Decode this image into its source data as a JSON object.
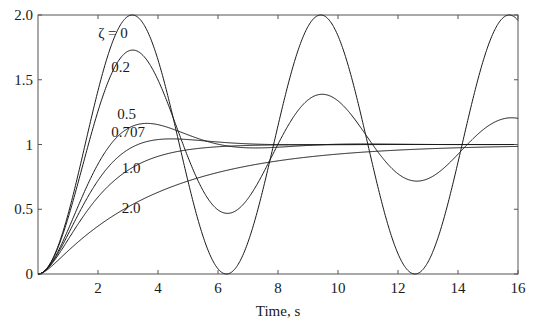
{
  "chart_data": {
    "type": "line",
    "title": "",
    "xlabel": "Time, s",
    "ylabel": "",
    "xlim": [
      0,
      16
    ],
    "ylim": [
      0,
      2.0
    ],
    "grid": false,
    "legend": "inline curve labels",
    "x_ticks": [
      2,
      4,
      6,
      8,
      10,
      12,
      14,
      16
    ],
    "x_tick_labels": [
      "2",
      "4",
      "6",
      "8",
      "10",
      "12",
      "14",
      "16"
    ],
    "y_ticks": [
      0,
      0.5,
      1,
      1.5,
      2.0
    ],
    "y_tick_labels": [
      "0",
      "0.5",
      "1",
      "1.5",
      "2.0"
    ],
    "x": [
      0,
      1,
      2,
      3,
      4,
      5,
      6,
      7,
      8,
      9,
      10,
      11,
      12,
      13,
      14,
      15,
      16
    ],
    "series": [
      {
        "name": "ζ = 0",
        "zeta_curve": 0,
        "values": [
          0,
          0.46,
          1.42,
          1.99,
          1.65,
          0.72,
          0.04,
          0.25,
          1.15,
          1.91,
          1.84,
          1.0,
          0.16,
          0.09,
          0.86,
          1.76,
          1.96
        ]
      },
      {
        "name": "0.2",
        "zeta_curve": 0.1,
        "values": [
          0,
          0.45,
          1.36,
          1.71,
          1.45,
          0.89,
          0.52,
          0.64,
          1.12,
          1.37,
          1.25,
          0.96,
          0.78,
          0.82,
          1.01,
          1.16,
          1.14
        ]
      },
      {
        "name": "0.5",
        "zeta_curve": 0.5,
        "values": [
          0,
          0.34,
          0.84,
          1.11,
          1.16,
          1.09,
          1.02,
          0.99,
          0.99,
          1.0,
          1.0,
          1.0,
          1.0,
          1.0,
          1.0,
          1.0,
          1.0
        ]
      },
      {
        "name": "0.707",
        "zeta_curve": 0.707,
        "values": [
          0,
          0.31,
          0.74,
          0.98,
          1.05,
          1.05,
          1.02,
          1.01,
          1.0,
          1.0,
          1.0,
          1.0,
          1.0,
          1.0,
          1.0,
          1.0,
          1.0
        ]
      },
      {
        "name": "1.0",
        "zeta_curve": 1.0,
        "values": [
          0,
          0.26,
          0.59,
          0.8,
          0.91,
          0.96,
          0.98,
          0.99,
          1.0,
          1.0,
          1.0,
          1.0,
          1.0,
          1.0,
          1.0,
          1.0,
          1.0
        ]
      },
      {
        "name": "2.0",
        "zeta_curve": 2.0,
        "values": [
          0,
          0.17,
          0.39,
          0.54,
          0.65,
          0.73,
          0.79,
          0.84,
          0.87,
          0.9,
          0.92,
          0.94,
          0.95,
          0.96,
          0.97,
          0.98,
          0.98
        ]
      }
    ],
    "annotations": [
      {
        "text": "ζ = 0",
        "x": 2.5,
        "y": 1.82
      },
      {
        "text": "0.2",
        "x": 2.75,
        "y": 1.56
      },
      {
        "text": "0.5",
        "x": 2.95,
        "y": 1.2
      },
      {
        "text": "0.707",
        "x": 3.0,
        "y": 1.06
      },
      {
        "text": "1.0",
        "x": 3.1,
        "y": 0.78
      },
      {
        "text": "2.0",
        "x": 3.1,
        "y": 0.47
      }
    ]
  },
  "style": {
    "line_color": "#1a1a1a",
    "axis_color": "#555555",
    "background": "#ffffff"
  }
}
